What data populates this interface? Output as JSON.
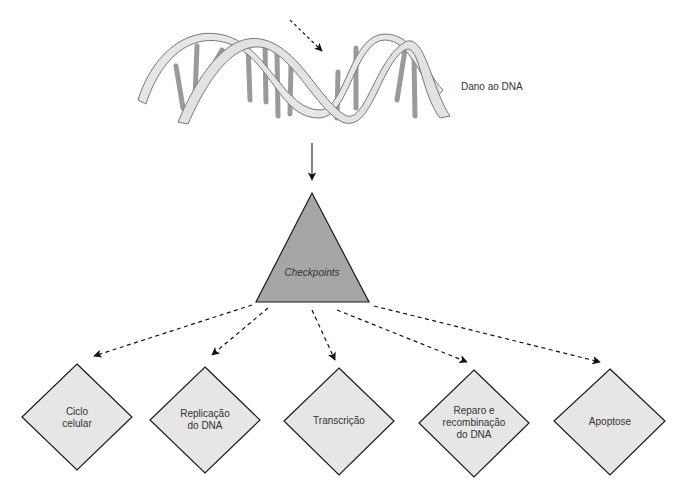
{
  "diagram": {
    "dna_label": "Dano ao DNA",
    "hub": {
      "label": "Checkpoints",
      "shape": "triangle",
      "fill": "#a6a6a6"
    },
    "nodes": [
      {
        "id": "ciclo",
        "lines": [
          "Ciclo",
          "celular"
        ],
        "label": "Ciclo celular"
      },
      {
        "id": "replicacao",
        "lines": [
          "Replicação",
          "do DNA"
        ],
        "label": "Replicação do DNA"
      },
      {
        "id": "transcricao",
        "lines": [
          "Transcrição"
        ],
        "label": "Transcrição"
      },
      {
        "id": "reparo",
        "lines": [
          "Reparo e",
          "recombinação",
          "do DNA"
        ],
        "label": "Reparo e recombinação do DNA"
      },
      {
        "id": "apoptose",
        "lines": [
          "Apoptose"
        ],
        "label": "Apoptose"
      }
    ],
    "edges": [
      {
        "from": "dna",
        "to": "checkpoints",
        "style": "solid"
      },
      {
        "from": "checkpoints",
        "to": "ciclo",
        "style": "dashed"
      },
      {
        "from": "checkpoints",
        "to": "replicacao",
        "style": "dashed"
      },
      {
        "from": "checkpoints",
        "to": "transcricao",
        "style": "dashed"
      },
      {
        "from": "checkpoints",
        "to": "reparo",
        "style": "dashed"
      },
      {
        "from": "checkpoints",
        "to": "apoptose",
        "style": "dashed"
      }
    ],
    "colors": {
      "node_fill": "#e6e6e6",
      "hub_fill": "#a6a6a6",
      "stroke": "#222222",
      "dna_strand": "#e8e8e8",
      "dna_base": "#999999"
    }
  }
}
